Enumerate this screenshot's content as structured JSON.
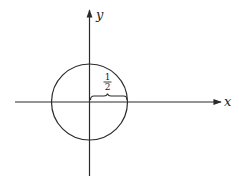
{
  "diagram": {
    "type": "circle-on-cartesian-axes",
    "axes": {
      "x_label": "x",
      "y_label": "y"
    },
    "circle": {
      "center_label": "origin",
      "radius_label_numerator": "1",
      "radius_label_denominator": "2"
    },
    "colors": {
      "stroke": "#2a2a2a",
      "background": "#ffffff"
    }
  }
}
